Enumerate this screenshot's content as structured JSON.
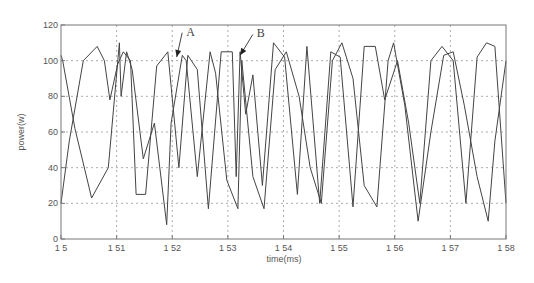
{
  "chart_data": {
    "type": "line",
    "title": "",
    "xlabel": "time(ms)",
    "ylabel": "power(w)",
    "xlim": [
      1.5,
      1.58
    ],
    "ylim": [
      0,
      120
    ],
    "grid": true,
    "grid_style": "dotted",
    "x_ticks": [
      "1.5",
      "1.51",
      "1.52",
      "1.53",
      "1.54",
      "1.55",
      "1.56",
      "1.57",
      "1.58"
    ],
    "y_ticks": [
      "0",
      "20",
      "40",
      "60",
      "80",
      "100",
      "120"
    ],
    "annotations": [
      {
        "label": "A",
        "text_at": [
          1.5225,
          114
        ],
        "arrow_to": [
          1.5208,
          102
        ]
      },
      {
        "label": "B",
        "text_at": [
          1.5352,
          113
        ],
        "arrow_to": [
          1.5322,
          103
        ]
      }
    ],
    "series": [
      {
        "name": "trace-1",
        "x": [
          1.5,
          1.5003,
          1.5025,
          1.5055,
          1.5085,
          1.5105,
          1.5108,
          1.5118,
          1.5128,
          1.5148,
          1.5168,
          1.519,
          1.5198,
          1.5218,
          1.5225,
          1.5245,
          1.5268,
          1.5278,
          1.5298,
          1.5318,
          1.5325,
          1.5345,
          1.5365,
          1.5385,
          1.5405,
          1.5428,
          1.5448,
          1.5468,
          1.5488,
          1.5505,
          1.5525,
          1.5545,
          1.5568,
          1.5588,
          1.5598,
          1.5618,
          1.5642,
          1.5665,
          1.5688,
          1.5705,
          1.5725,
          1.5748,
          1.5768,
          1.578,
          1.58
        ],
        "y": [
          103,
          100,
          62,
          23,
          40,
          110,
          80,
          105,
          95,
          45,
          65,
          8,
          65,
          103,
          100,
          35,
          105,
          93,
          33,
          17,
          100,
          35,
          17,
          95,
          105,
          80,
          40,
          20,
          100,
          110,
          90,
          30,
          18,
          100,
          110,
          75,
          10,
          60,
          103,
          105,
          75,
          35,
          10,
          55,
          100
        ]
      },
      {
        "name": "trace-2",
        "x": [
          1.5,
          1.5015,
          1.504,
          1.5065,
          1.5078,
          1.5088,
          1.5102,
          1.5112,
          1.5125,
          1.5135,
          1.5152,
          1.5172,
          1.5192,
          1.5212,
          1.5228,
          1.5245,
          1.5265,
          1.5288,
          1.5308,
          1.5315,
          1.5322,
          1.5332,
          1.5345,
          1.5362,
          1.5382,
          1.5402,
          1.5425,
          1.5442,
          1.5465,
          1.5485,
          1.5502,
          1.5525,
          1.5545,
          1.5565,
          1.5582,
          1.5605,
          1.5625,
          1.5645,
          1.5665,
          1.5685,
          1.5705,
          1.5728,
          1.5748,
          1.5765,
          1.578,
          1.58
        ],
        "y": [
          20,
          55,
          100,
          108,
          100,
          78,
          98,
          105,
          100,
          25,
          25,
          97,
          105,
          40,
          103,
          95,
          17,
          105,
          105,
          35,
          105,
          70,
          92,
          30,
          110,
          102,
          25,
          108,
          20,
          105,
          102,
          18,
          108,
          108,
          78,
          100,
          65,
          20,
          100,
          108,
          100,
          20,
          102,
          110,
          108,
          20
        ]
      }
    ]
  },
  "layout": {
    "plot_left": 61,
    "plot_top": 25,
    "plot_right": 506,
    "plot_bottom": 239,
    "line_color": "#444444",
    "grid_color": "#999999",
    "axis_color": "#777777"
  }
}
